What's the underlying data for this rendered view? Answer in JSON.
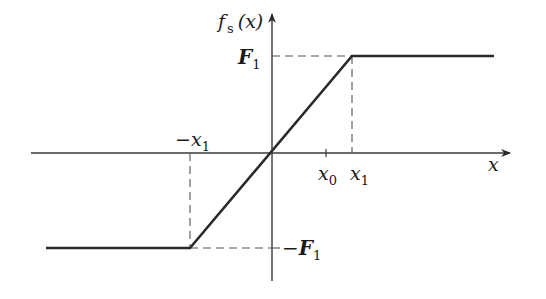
{
  "diagram": {
    "colors": {
      "background": "#ffffff",
      "curve": "#2a2a2a",
      "axis": "#3a3a3a",
      "dashed": "#555555",
      "text": "#1a1a1a"
    },
    "axes": {
      "x_label": "x",
      "y_label_f": "f",
      "y_label_sub": "s",
      "y_label_arg": "(x)"
    },
    "labels": {
      "F1_top": {
        "main": "F",
        "sub": "1"
      },
      "F1_bottom": {
        "prefix": "−",
        "main": "F",
        "sub": "1"
      },
      "neg_x1": {
        "prefix": "−",
        "main": "x",
        "sub": "1"
      },
      "x0": {
        "main": "x",
        "sub": "0"
      },
      "x1": {
        "main": "x",
        "sub": "1"
      }
    },
    "curve_points": [
      {
        "label": "left plateau start",
        "x": -1.5,
        "y": -1
      },
      {
        "label": "-x1 corner",
        "x": -1,
        "y": -1
      },
      {
        "label": "origin",
        "x": 0,
        "y": 0
      },
      {
        "label": "x1 corner",
        "x": 1,
        "y": 1
      },
      {
        "label": "right plateau end",
        "x": 1.75,
        "y": 1
      }
    ]
  }
}
